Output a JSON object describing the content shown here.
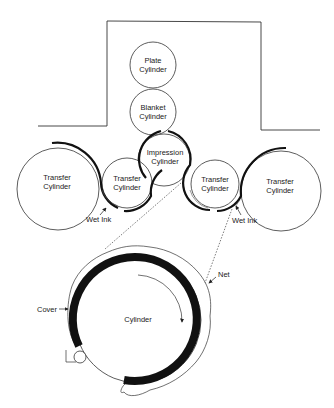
{
  "diagram": {
    "cylinders": {
      "plate": {
        "line1": "Plate",
        "line2": "Cylinder"
      },
      "blanket": {
        "line1": "Blanket",
        "line2": "Cylinder"
      },
      "impression": {
        "line1": "Impression",
        "line2": "Cylinder"
      },
      "transfer_left_large": {
        "line1": "Transfer",
        "line2": "Cylinder"
      },
      "transfer_left_small": {
        "line1": "Transfer",
        "line2": "Cylinder"
      },
      "transfer_right_small": {
        "line1": "Transfer",
        "line2": "Cylinder"
      },
      "transfer_right_large": {
        "line1": "Transfer",
        "line2": "Cylinder"
      }
    },
    "annotations": {
      "wet_ink_left": "Wet Ink",
      "wet_ink_right": "Wet Ink"
    },
    "detail": {
      "cylinder_label": "Cylinder",
      "cover_label": "Cover",
      "net_label": "Net"
    },
    "colors": {
      "line": "#333333",
      "ink": "#111111",
      "background": "#ffffff"
    }
  }
}
